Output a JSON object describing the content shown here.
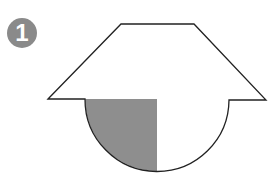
{
  "problem": {
    "number": "1"
  },
  "figure": {
    "colors": {
      "stroke": "#222222",
      "shade": "#8e8e8e",
      "fill": "#ffffff",
      "badge": "#8a8a8a"
    },
    "trapezoid": {
      "top_left": [
        121,
        24
      ],
      "top_right": [
        194,
        24
      ],
      "bottom_left": [
        48,
        99
      ],
      "bottom_right": [
        266,
        100
      ]
    },
    "semicircle": {
      "center": [
        157,
        99
      ],
      "radius": 72
    },
    "shaded_region": "left quarter of semicircle (between x=85 and center x=157)"
  }
}
